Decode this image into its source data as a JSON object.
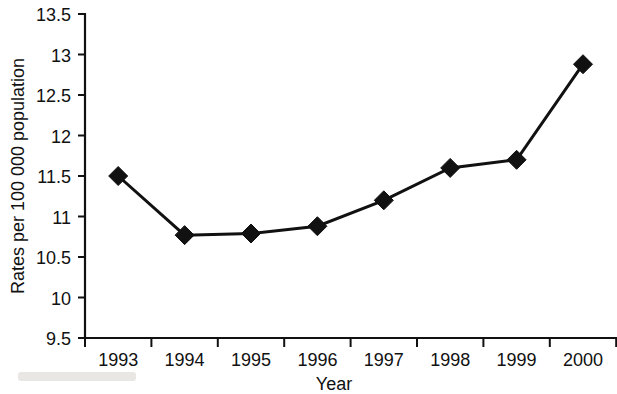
{
  "chart_data": {
    "type": "line",
    "title": "",
    "xlabel": "Year",
    "ylabel": "Rates per 100 000 population",
    "categories": [
      "1993",
      "1994",
      "1995",
      "1996",
      "1997",
      "1998",
      "1999",
      "2000"
    ],
    "values": [
      11.5,
      10.77,
      10.79,
      10.88,
      11.2,
      11.6,
      11.7,
      12.88
    ],
    "series": [
      {
        "name": "Rates per 100 000 population",
        "values": [
          11.5,
          10.77,
          10.79,
          10.88,
          11.2,
          11.6,
          11.7,
          12.88
        ]
      }
    ],
    "ylim": [
      9.5,
      13.5
    ],
    "yticks": [
      9.5,
      10,
      10.5,
      11,
      11.5,
      12,
      12.5,
      13,
      13.5
    ],
    "ytick_labels": [
      "9.5",
      "10",
      "10.5",
      "11",
      "11.5",
      "12",
      "12.5",
      "13",
      "13.5"
    ],
    "xtick_labels": [
      "1993",
      "1994",
      "1995",
      "1996",
      "1997",
      "1998",
      "1999",
      "2000"
    ],
    "grid": false,
    "legend": "none",
    "marker": "diamond",
    "line_color": "#111111",
    "marker_color": "#111111",
    "background_color": "#ffffff"
  },
  "axes": {
    "y_title": "Rates per 100 000 population",
    "x_title": "Year"
  },
  "y_ticks": [
    {
      "label": "13.5",
      "value": 13.5
    },
    {
      "label": "13",
      "value": 13
    },
    {
      "label": "12.5",
      "value": 12.5
    },
    {
      "label": "12",
      "value": 12
    },
    {
      "label": "11.5",
      "value": 11.5
    },
    {
      "label": "11",
      "value": 11
    },
    {
      "label": "10.5",
      "value": 10.5
    },
    {
      "label": "10",
      "value": 10
    },
    {
      "label": "9.5",
      "value": 9.5
    }
  ],
  "x_ticks": [
    {
      "label": "1993",
      "value": 11.5
    },
    {
      "label": "1994",
      "value": 10.77
    },
    {
      "label": "1995",
      "value": 10.79
    },
    {
      "label": "1996",
      "value": 10.88
    },
    {
      "label": "1997",
      "value": 11.2
    },
    {
      "label": "1998",
      "value": 11.6
    },
    {
      "label": "1999",
      "value": 11.7
    },
    {
      "label": "2000",
      "value": 12.88
    }
  ]
}
